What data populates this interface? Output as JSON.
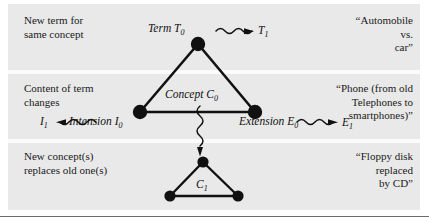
{
  "figure": {
    "panel_color": "#e9e9e9",
    "line_color": "#111111",
    "text_color": "#1a1a1a"
  },
  "rows": [
    {
      "caption": "New term for\nsame concept",
      "example": "“Automobile\nvs.\ncar”"
    },
    {
      "caption": "Content of term\nchanges",
      "example": "“Phone (from old\nTelephones to\nsmartphones)”"
    },
    {
      "caption": "New concept(s)\nreplaces old one(s)",
      "example": "“Floppy disk\nreplaced\nby CD”"
    }
  ],
  "diagram": {
    "term_t0": "Term T",
    "term_t0_sub": "0",
    "term_t1": "T",
    "term_t1_sub": "1",
    "concept_c0": "Concept C",
    "concept_c0_sub": "0",
    "intension_i0": "Intension I",
    "intension_i0_sub": "0",
    "intension_i1": "I",
    "intension_i1_sub": "1",
    "extension_e0": "Extension E",
    "extension_e0_sub": "0",
    "extension_e1": "E",
    "extension_e1_sub": "1",
    "concept_c1": "C",
    "concept_c1_sub": "1"
  },
  "nodes": {
    "upper_triangle": {
      "apex": [
        198,
        44
      ],
      "left": [
        140,
        112
      ],
      "right": [
        255,
        112
      ]
    },
    "lower_triangle": {
      "apex": [
        203,
        162
      ],
      "left": [
        170,
        196
      ],
      "right": [
        238,
        196
      ]
    }
  },
  "arrows": [
    {
      "name": "term-change-arrow",
      "direction": "right",
      "from": [
        216,
        31
      ],
      "to": [
        254,
        31
      ]
    },
    {
      "name": "intension-change-arrow",
      "direction": "left",
      "from": [
        96,
        122
      ],
      "to": [
        56,
        122
      ]
    },
    {
      "name": "extension-change-arrow",
      "direction": "right",
      "from": [
        297,
        122
      ],
      "to": [
        338,
        122
      ]
    },
    {
      "name": "concept-replacement-arrow",
      "direction": "down",
      "from": [
        200,
        106
      ],
      "to": [
        200,
        156
      ]
    }
  ]
}
